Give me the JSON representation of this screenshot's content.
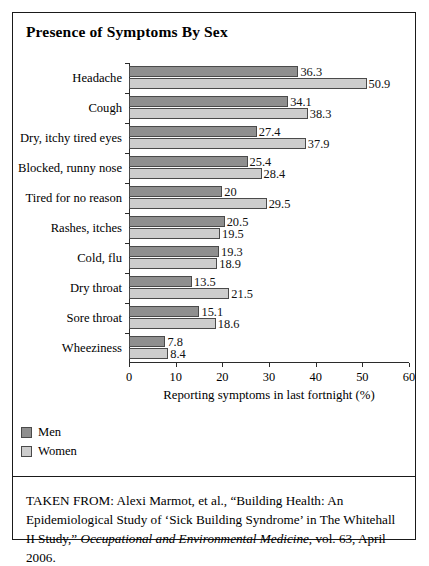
{
  "figure": {
    "title": "Presence of Symptoms By Sex",
    "source_prefix": "TAKEN FROM: Alexi Marmot, et al., “Building Health: An Epidemiological Study of ‘Sick Building Syndrome’ in The Whitehall II Study,” ",
    "source_journal": "Occupational and Environmental Medicine",
    "source_suffix": ", vol. 63, April 2006."
  },
  "colors": {
    "men": "#8f8f8f",
    "women": "#cdcdcd",
    "border": "#1a1a1a",
    "bar_outline": "#4a4a4a"
  },
  "legend": {
    "position": "below-plot-left",
    "items": [
      {
        "label": "Men",
        "key": "men"
      },
      {
        "label": "Women",
        "key": "women"
      }
    ]
  },
  "chart_data": {
    "type": "bar",
    "orientation": "horizontal",
    "title": "Presence of Symptoms By Sex",
    "xlabel": "Reporting symptoms in last fortnight (%)",
    "ylabel": "",
    "xlim": [
      0,
      60
    ],
    "xticks": [
      0,
      10,
      20,
      30,
      40,
      50,
      60
    ],
    "grid": false,
    "legend_position": "below-plot-left",
    "categories": [
      "Headache",
      "Cough",
      "Dry, itchy tired eyes",
      "Blocked, runny nose",
      "Tired for no reason",
      "Rashes, itches",
      "Cold, flu",
      "Dry throat",
      "Sore throat",
      "Wheeziness"
    ],
    "series": [
      {
        "name": "Men",
        "color": "#8f8f8f",
        "values": [
          36.3,
          34.1,
          27.4,
          25.4,
          20,
          20.5,
          19.3,
          13.5,
          15.1,
          7.8
        ],
        "labels": [
          "36.3",
          "34.1",
          "27.4",
          "25.4",
          "20",
          "20.5",
          "19.3",
          "13.5",
          "15.1",
          "7.8"
        ]
      },
      {
        "name": "Women",
        "color": "#cdcdcd",
        "values": [
          50.9,
          38.3,
          37.9,
          28.4,
          29.5,
          19.5,
          18.9,
          21.5,
          18.6,
          8.4
        ],
        "labels": [
          "50.9",
          "38.3",
          "37.9",
          "28.4",
          "29.5",
          "19.5",
          "18.9",
          "21.5",
          "18.6",
          "8.4"
        ]
      }
    ]
  }
}
